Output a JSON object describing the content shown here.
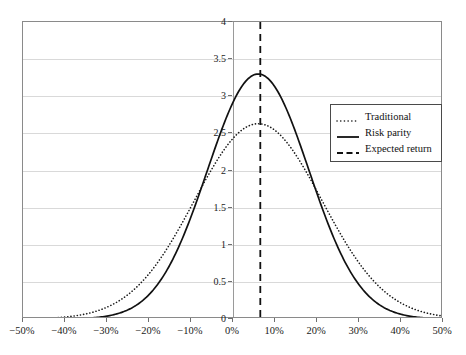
{
  "chart_data": {
    "type": "line",
    "title": "",
    "xlabel": "",
    "ylabel": "",
    "xlim": [
      -50,
      50
    ],
    "ylim": [
      0,
      4
    ],
    "grid": true,
    "legend_position": "upper-right",
    "x_tick_labels": [
      "−50%",
      "−40%",
      "−30%",
      "−20%",
      "−10%",
      "0%",
      "10%",
      "20%",
      "30%",
      "40%",
      "50%"
    ],
    "x_tick_values": [
      -50,
      -40,
      -30,
      -20,
      -10,
      0,
      10,
      20,
      30,
      40,
      50
    ],
    "y_tick_labels": [
      "0",
      "0.5",
      "1",
      "1.5",
      "2",
      "2.5",
      "3",
      "3.5",
      "4"
    ],
    "y_tick_values": [
      0,
      0.5,
      1,
      1.5,
      2,
      2.5,
      3,
      3.5,
      4
    ],
    "series": [
      {
        "name": "Traditional",
        "style": "dotted",
        "color": "#1a1a1a",
        "distribution": {
          "mean": 6.0,
          "sigma": 15.2,
          "peak": 2.63
        },
        "x": [
          -50,
          -45,
          -40,
          -35,
          -30,
          -25,
          -20,
          -15,
          -10,
          -5,
          0,
          5,
          6,
          10,
          15,
          20,
          25,
          30,
          35,
          40,
          45,
          50
        ],
        "values": [
          0.01,
          0.02,
          0.05,
          0.12,
          0.25,
          0.47,
          0.8,
          1.22,
          1.7,
          2.15,
          2.48,
          2.62,
          2.63,
          2.54,
          2.18,
          1.68,
          1.16,
          0.71,
          0.38,
          0.18,
          0.08,
          0.03
        ]
      },
      {
        "name": "Risk parity",
        "style": "solid",
        "color": "#111111",
        "distribution": {
          "mean": 6.0,
          "sigma": 12.1,
          "peak": 3.3
        },
        "x": [
          -50,
          -45,
          -40,
          -35,
          -30,
          -25,
          -20,
          -15,
          -10,
          -5,
          0,
          5,
          6,
          10,
          15,
          20,
          25,
          30,
          35,
          40,
          45,
          50
        ],
        "values": [
          0.0,
          0.0,
          0.01,
          0.03,
          0.1,
          0.26,
          0.58,
          1.1,
          1.8,
          2.55,
          3.12,
          3.29,
          3.3,
          3.11,
          2.51,
          1.77,
          1.08,
          0.57,
          0.26,
          0.1,
          0.03,
          0.01
        ]
      }
    ],
    "annotations": [
      {
        "name": "Expected return",
        "style": "dashed",
        "color": "#111111",
        "orientation": "vertical",
        "x_value": 6.5
      }
    ]
  },
  "legend": {
    "items": [
      {
        "label": "Traditional",
        "style": "dotted"
      },
      {
        "label": "Risk parity",
        "style": "solid"
      },
      {
        "label": "Expected return",
        "style": "dashed"
      }
    ]
  }
}
